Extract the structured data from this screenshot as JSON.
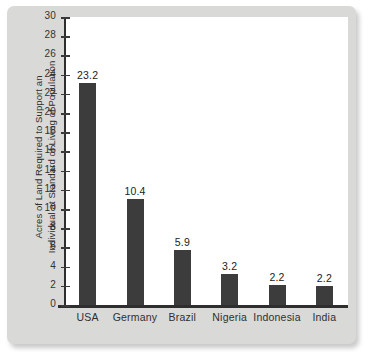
{
  "chart_data": {
    "type": "bar",
    "title": "",
    "subtitle": "",
    "xlabel": "",
    "ylabel_lines": [
      "Acres of Land Required to Support an",
      "Individual at Standard of Living of Population"
    ],
    "categories": [
      "USA",
      "Germany",
      "Brazil",
      "Nigeria",
      "Indonesia",
      "India"
    ],
    "values": [
      23.2,
      10.4,
      5.9,
      3.2,
      2.2,
      2.2
    ],
    "data_labels": [
      "23.2",
      "10.4",
      "5.9",
      "3.2",
      "2.2",
      "2.2"
    ],
    "plotted_heights": [
      23.1,
      11.0,
      5.7,
      3.2,
      2.1,
      2.0
    ],
    "ylim": [
      0,
      30
    ],
    "ytick_step": 2,
    "yticks": [
      0,
      2,
      4,
      6,
      8,
      10,
      12,
      14,
      16,
      18,
      20,
      22,
      24,
      26,
      28,
      30
    ],
    "ytick_labels": [
      "0",
      "2",
      "4",
      "6",
      "8",
      "10",
      "12",
      "14",
      "16",
      "18",
      "20",
      "22",
      "24",
      "26",
      "28",
      "30"
    ],
    "grid": false,
    "legend": null,
    "legend_position": "none",
    "colors": {
      "bar": "#3c3c3c",
      "axis": "#2e2e2e",
      "plot_background": "#ffffff",
      "figure_background": "#d9d9d7",
      "text": "#2f2f2f"
    }
  }
}
